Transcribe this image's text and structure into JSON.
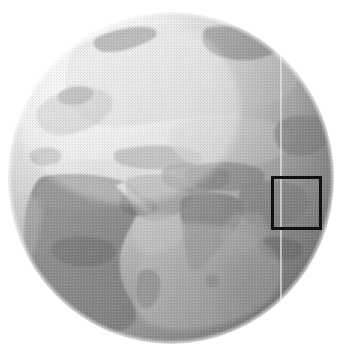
{
  "figure": {
    "width": 347,
    "height": 358,
    "background_color": "#ffffff",
    "caption": ""
  },
  "globe": {
    "name": "earth-globe",
    "projection": "orthographic",
    "view_center_label": "Africa / Asia / Indian Ocean",
    "center_x": 171,
    "center_y": 178,
    "radius_x": 163,
    "radius_y": 166,
    "bounds": {
      "left": 8,
      "top": 12,
      "right": 334,
      "bottom": 344
    },
    "style": "halftone-grayscale",
    "shading": {
      "light_from": "upper-left",
      "highlight_color": "#fbfbfb",
      "midtone_color": "#b8b8b8",
      "shadow_color": "#8d8d8d",
      "limb_color": "#7a7a7a"
    },
    "ocean_color": "#cfcfcf",
    "land_color": "#a6a6a6"
  },
  "meridian_line": {
    "name": "meridian-line",
    "x": 281,
    "y_top": 24,
    "y_bottom": 320,
    "color": "#eeeeee",
    "width": 1.4
  },
  "highlight_box": {
    "name": "region-highlight-box",
    "x": 271,
    "y": 176,
    "width": 51,
    "height": 54,
    "stroke_color": "#101010",
    "stroke_width": 3,
    "fill": "none",
    "label": ""
  },
  "landmasses": [
    {
      "id": "eurasia-north",
      "label": "Northern Eurasia / Siberia",
      "tone": "light"
    },
    {
      "id": "europe",
      "label": "Europe",
      "tone": "light"
    },
    {
      "id": "africa",
      "label": "Africa",
      "tone": "dark"
    },
    {
      "id": "arabia",
      "label": "Arabian Peninsula",
      "tone": "mid"
    },
    {
      "id": "india",
      "label": "Indian Subcontinent",
      "tone": "mid"
    },
    {
      "id": "southeast-asia",
      "label": "Southeast Asia",
      "tone": "mid"
    },
    {
      "id": "madagascar",
      "label": "Madagascar",
      "tone": "dark"
    },
    {
      "id": "indian-ocean",
      "label": "Indian Ocean",
      "tone": "light"
    }
  ]
}
